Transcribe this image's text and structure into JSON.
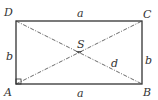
{
  "diagram": {
    "type": "rectangle-with-diagonals",
    "vertices": {
      "A": "A",
      "B": "B",
      "C": "C",
      "D": "D"
    },
    "center": "S",
    "sides": {
      "top": "a",
      "bottom": "a",
      "left": "b",
      "right": "b"
    },
    "diagonal": "d",
    "colors": {
      "stroke": "#333333",
      "background": "#ffffff"
    }
  }
}
